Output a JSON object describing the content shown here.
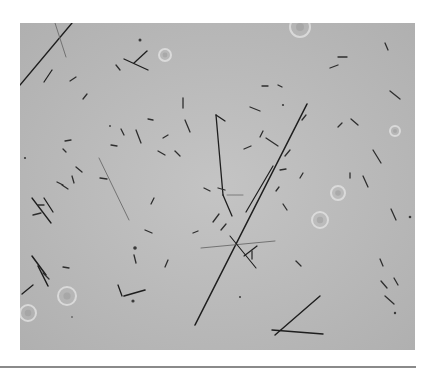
{
  "figure": {
    "type": "phase-contrast micrograph",
    "background_color": "#b9b9b9",
    "rod_color": "#1e1e1e",
    "faint_rod_color": "#6a6a6a",
    "long_rods": [
      {
        "x1": 0,
        "y1": 62,
        "x2": 52,
        "y2": 0,
        "w": 1.4
      },
      {
        "x1": 175,
        "y1": 302,
        "x2": 287,
        "y2": 81,
        "w": 1.6
      },
      {
        "x1": 196,
        "y1": 92,
        "x2": 203,
        "y2": 172,
        "w": 1.3
      },
      {
        "x1": 203,
        "y1": 172,
        "x2": 212,
        "y2": 193,
        "w": 1.3
      },
      {
        "x1": 196,
        "y1": 92,
        "x2": 205,
        "y2": 98,
        "w": 1.3
      },
      {
        "x1": 226,
        "y1": 189,
        "x2": 253,
        "y2": 143,
        "w": 1.2
      },
      {
        "x1": 255,
        "y1": 312,
        "x2": 300,
        "y2": 273,
        "w": 1.4
      },
      {
        "x1": 252,
        "y1": 307,
        "x2": 303,
        "y2": 311,
        "w": 1.4
      },
      {
        "x1": 79,
        "y1": 135,
        "x2": 109,
        "y2": 197,
        "w": 0.9,
        "faint": true
      },
      {
        "x1": 181,
        "y1": 225,
        "x2": 255,
        "y2": 218,
        "w": 0.9,
        "faint": true
      },
      {
        "x1": 35,
        "y1": 0,
        "x2": 46,
        "y2": 34,
        "w": 0.9,
        "faint": true
      },
      {
        "x1": 24,
        "y1": 175,
        "x2": 33,
        "y2": 189,
        "w": 1.3
      },
      {
        "x1": 12,
        "y1": 175,
        "x2": 31,
        "y2": 200,
        "w": 1.3
      },
      {
        "x1": 12,
        "y1": 233,
        "x2": 26,
        "y2": 252,
        "w": 1.5
      },
      {
        "x1": 18,
        "y1": 243,
        "x2": 28,
        "y2": 263,
        "w": 1.5
      },
      {
        "x1": 2,
        "y1": 271,
        "x2": 13,
        "y2": 262,
        "w": 1.3
      },
      {
        "x1": 104,
        "y1": 273,
        "x2": 125,
        "y2": 267,
        "w": 1.6
      },
      {
        "x1": 98,
        "y1": 262,
        "x2": 102,
        "y2": 273,
        "w": 1.3
      },
      {
        "x1": 104,
        "y1": 36,
        "x2": 128,
        "y2": 47,
        "w": 1.3
      },
      {
        "x1": 114,
        "y1": 40,
        "x2": 127,
        "y2": 28,
        "w": 1.3
      },
      {
        "x1": 224,
        "y1": 233,
        "x2": 237,
        "y2": 223,
        "w": 1.2
      },
      {
        "x1": 207,
        "y1": 172,
        "x2": 223,
        "y2": 172,
        "w": 0.8,
        "faint": true
      },
      {
        "x1": 210,
        "y1": 213,
        "x2": 236,
        "y2": 245,
        "w": 1.1
      },
      {
        "x1": 32,
        "y1": 47,
        "x2": 24,
        "y2": 59,
        "w": 1.2
      }
    ],
    "short_rods": [
      [
        50,
        58,
        56,
        54
      ],
      [
        96,
        42,
        100,
        47
      ],
      [
        163,
        75,
        163,
        85
      ],
      [
        165,
        97,
        170,
        109
      ],
      [
        230,
        84,
        240,
        88
      ],
      [
        246,
        115,
        258,
        123
      ],
      [
        242,
        63,
        248,
        63
      ],
      [
        258,
        62,
        262,
        64
      ],
      [
        198,
        165,
        205,
        167
      ],
      [
        260,
        147,
        266,
        146
      ],
      [
        265,
        133,
        270,
        127
      ],
      [
        280,
        155,
        283,
        150
      ],
      [
        310,
        45,
        318,
        42
      ],
      [
        322,
        100,
        318,
        104
      ],
      [
        331,
        96,
        338,
        102
      ],
      [
        330,
        150,
        330,
        155
      ],
      [
        343,
        153,
        348,
        164
      ],
      [
        353,
        127,
        361,
        140
      ],
      [
        371,
        186,
        376,
        197
      ],
      [
        361,
        258,
        367,
        265
      ],
      [
        365,
        273,
        374,
        281
      ],
      [
        360,
        236,
        363,
        243
      ],
      [
        374,
        255,
        378,
        262
      ],
      [
        116,
        107,
        121,
        120
      ],
      [
        138,
        128,
        145,
        132
      ],
      [
        143,
        115,
        148,
        112
      ],
      [
        155,
        128,
        160,
        133
      ],
      [
        134,
        175,
        131,
        181
      ],
      [
        101,
        106,
        104,
        112
      ],
      [
        125,
        207,
        132,
        210
      ],
      [
        173,
        210,
        178,
        208
      ],
      [
        193,
        199,
        199,
        191
      ],
      [
        201,
        207,
        206,
        201
      ],
      [
        232,
        228,
        232,
        236
      ],
      [
        256,
        168,
        259,
        164
      ],
      [
        263,
        181,
        267,
        187
      ],
      [
        45,
        118,
        51,
        117
      ],
      [
        43,
        126,
        46,
        129
      ],
      [
        37,
        159,
        43,
        162
      ],
      [
        56,
        144,
        62,
        149
      ],
      [
        52,
        153,
        54,
        160
      ],
      [
        18,
        182,
        24,
        182
      ],
      [
        42,
        162,
        48,
        166
      ],
      [
        63,
        76,
        67,
        71
      ],
      [
        80,
        155,
        87,
        156
      ],
      [
        282,
        97,
        286,
        92
      ],
      [
        370,
        68,
        380,
        76
      ],
      [
        318,
        34,
        327,
        34
      ],
      [
        365,
        20,
        368,
        27
      ],
      [
        43,
        244,
        49,
        245
      ],
      [
        13,
        192,
        21,
        190
      ],
      [
        23,
        250,
        29,
        256
      ],
      [
        114,
        232,
        116,
        240
      ],
      [
        145,
        244,
        148,
        237
      ],
      [
        276,
        238,
        281,
        243
      ],
      [
        224,
        126,
        231,
        123
      ],
      [
        91,
        122,
        97,
        123
      ],
      [
        128,
        96,
        133,
        97
      ],
      [
        240,
        114,
        243,
        108
      ],
      [
        184,
        165,
        190,
        168
      ]
    ],
    "dots": [
      [
        115,
        225,
        1.8
      ],
      [
        113,
        278,
        1.6
      ],
      [
        120,
        17,
        1.5
      ],
      [
        390,
        194,
        1.3
      ],
      [
        375,
        290,
        1.2
      ],
      [
        263,
        82,
        1.1
      ],
      [
        5,
        135,
        1.1
      ],
      [
        90,
        103,
        0.9
      ],
      [
        220,
        274,
        1.0
      ],
      [
        52,
        294,
        0.8
      ]
    ],
    "halos": [
      [
        145,
        32,
        6
      ],
      [
        280,
        4,
        10
      ],
      [
        318,
        170,
        7
      ],
      [
        47,
        273,
        9
      ],
      [
        8,
        290,
        8
      ],
      [
        300,
        197,
        8
      ],
      [
        375,
        108,
        5
      ]
    ]
  },
  "divider": {
    "color": "#8a8a8a"
  }
}
